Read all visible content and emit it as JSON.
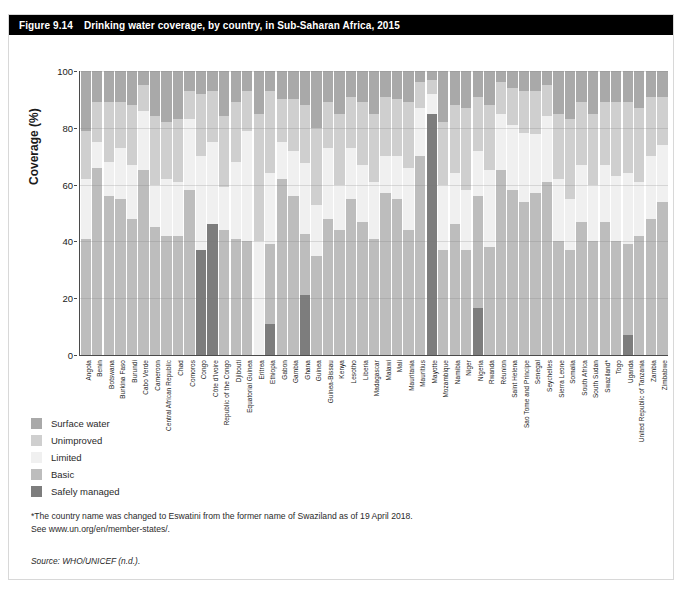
{
  "figure": {
    "number": "Figure 9.14",
    "title": "Drinking water coverage, by country, in Sub-Saharan Africa, 2015"
  },
  "legend": {
    "items": [
      {
        "label": "Surface water",
        "color": "#a9a9a9"
      },
      {
        "label": "Unimproved",
        "color": "#cfcfcf"
      },
      {
        "label": "Limited",
        "color": "#f0f0f0"
      },
      {
        "label": "Basic",
        "color": "#bdbdbd"
      },
      {
        "label": "Safely managed",
        "color": "#7d7d7d"
      }
    ]
  },
  "notes": {
    "line1": "*The country name was changed to Eswatini from the former name of Swaziland as of 19 April 2018.",
    "line2": "See www.un.org/en/member-states/.",
    "source": "Source: WHO/UNICEF (n.d.)."
  },
  "chart_data": {
    "type": "bar",
    "subtype": "stacked-bar-100",
    "title": "Drinking water coverage, by country, in Sub-Saharan Africa, 2015",
    "xlabel": "",
    "ylabel": "Coverage (%)",
    "ylim": [
      0,
      100
    ],
    "yticks": [
      0,
      20,
      40,
      60,
      80,
      100
    ],
    "grid": true,
    "legend_position": "below-left",
    "series_order": [
      "Safely managed",
      "Basic",
      "Limited",
      "Unimproved",
      "Surface water"
    ],
    "series_colors": {
      "Safely managed": "#7d7d7d",
      "Basic": "#bdbdbd",
      "Limited": "#f0f0f0",
      "Unimproved": "#cfcfcf",
      "Surface water": "#a9a9a9"
    },
    "categories": [
      "Angola",
      "Benin",
      "Botswana",
      "Burkina Faso",
      "Burundi",
      "Cabo Verde",
      "Cameroon",
      "Central African Republic",
      "Chad",
      "Comoros",
      "Congo",
      "Côte d'Ivoire",
      "Republic of the Congo",
      "Djibouti",
      "Equatorial Guinea",
      "Eritrea",
      "Ethiopia",
      "Gabon",
      "Gambia",
      "Ghana",
      "Guinea",
      "Guinea-Bissau",
      "Kenya",
      "Lesotho",
      "Liberia",
      "Madagascar",
      "Malawi",
      "Mali",
      "Mauritania",
      "Mauritius",
      "Mayotte",
      "Mozambique",
      "Namibia",
      "Niger",
      "Nigeria",
      "Rwanda",
      "Réunion",
      "Saint Helena",
      "Sao Tome and Principe",
      "Senegal",
      "Seychelles",
      "Sierra Leone",
      "Somalia",
      "South Africa",
      "South Sudan",
      "Swaziland*",
      "Togo",
      "Uganda",
      "United Republic of Tanzania",
      "Zambia",
      "Zimbabwe"
    ],
    "series": [
      {
        "name": "Safely managed",
        "values": [
          0,
          0,
          0,
          0,
          0,
          0,
          0,
          0,
          0,
          0,
          37,
          46,
          0,
          0,
          0,
          0,
          11,
          0,
          0,
          27,
          0,
          0,
          0,
          0,
          0,
          0,
          0,
          0,
          0,
          0,
          85,
          0,
          0,
          0,
          20,
          0,
          0,
          0,
          0,
          0,
          0,
          0,
          0,
          0,
          0,
          0,
          0,
          7,
          0,
          0,
          0
        ]
      },
      {
        "name": "Basic",
        "values": [
          41,
          66,
          56,
          55,
          48,
          65,
          45,
          42,
          42,
          58,
          0,
          0,
          44,
          41,
          40,
          0,
          28,
          62,
          56,
          27,
          35,
          48,
          44,
          55,
          47,
          41,
          57,
          55,
          44,
          70,
          0,
          37,
          46,
          37,
          47,
          38,
          65,
          58,
          54,
          57,
          61,
          40,
          37,
          47,
          40,
          47,
          40,
          32,
          42,
          48,
          54
        ]
      },
      {
        "name": "Limited",
        "values": [
          21,
          9,
          12,
          18,
          19,
          21,
          15,
          20,
          19,
          25,
          33,
          29,
          15,
          27,
          39,
          40,
          25,
          13,
          16,
          32,
          18,
          25,
          16,
          18,
          20,
          20,
          13,
          15,
          22,
          17,
          7,
          23,
          18,
          21,
          19,
          27,
          20,
          23,
          24,
          21,
          23,
          22,
          18,
          20,
          20,
          20,
          23,
          25,
          19,
          22,
          20
        ]
      },
      {
        "name": "Unimproved",
        "values": [
          17,
          14,
          21,
          16,
          21,
          9,
          24,
          20,
          22,
          10,
          22,
          18,
          25,
          21,
          14,
          45,
          29,
          15,
          18,
          26,
          27,
          16,
          25,
          18,
          22,
          24,
          21,
          20,
          23,
          9,
          5,
          22,
          24,
          29,
          23,
          23,
          11,
          13,
          15,
          15,
          11,
          23,
          28,
          22,
          25,
          22,
          26,
          25,
          26,
          21,
          17
        ]
      },
      {
        "name": "Surface water",
        "values": [
          21,
          11,
          11,
          11,
          12,
          5,
          16,
          18,
          17,
          7,
          8,
          7,
          16,
          11,
          7,
          15,
          7,
          10,
          10,
          15,
          20,
          11,
          15,
          9,
          11,
          15,
          9,
          10,
          11,
          4,
          3,
          18,
          12,
          13,
          11,
          12,
          4,
          6,
          7,
          7,
          5,
          15,
          17,
          11,
          15,
          11,
          11,
          11,
          13,
          9,
          9
        ]
      }
    ]
  }
}
